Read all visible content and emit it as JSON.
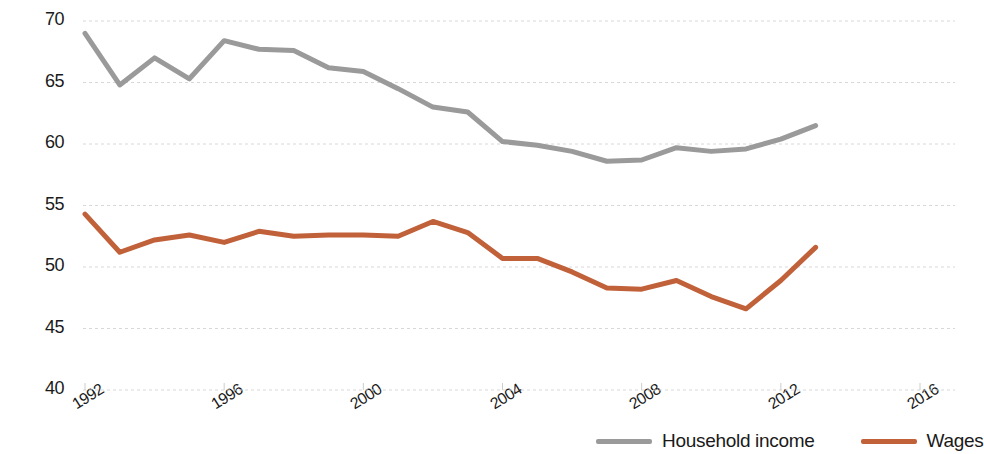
{
  "chart_data": {
    "type": "line",
    "title": "",
    "xlabel": "",
    "ylabel": "% of GDP",
    "xlim": [
      1992,
      2016.8
    ],
    "ylim": [
      40,
      70
    ],
    "grid": true,
    "legend_position": "bottom-right",
    "x_ticks": [
      "1992",
      "1996",
      "2000",
      "2004",
      "2008",
      "2012",
      "2016"
    ],
    "y_ticks": [
      "40",
      "45",
      "50",
      "55",
      "60",
      "65",
      "70"
    ],
    "x": [
      1992,
      1993,
      1994,
      1995,
      1996,
      1997,
      1998,
      1999,
      2000,
      2001,
      2002,
      2003,
      2004,
      2005,
      2006,
      2007,
      2008,
      2009,
      2010,
      2011,
      2012,
      2013
    ],
    "series": [
      {
        "name": "Household income",
        "color": "#9a9a9a",
        "values": [
          69.0,
          64.8,
          67.0,
          65.3,
          68.4,
          67.7,
          67.6,
          66.2,
          65.9,
          64.5,
          63.0,
          62.6,
          60.2,
          59.9,
          59.4,
          58.6,
          58.7,
          59.7,
          59.4,
          59.6,
          60.4,
          61.5
        ]
      },
      {
        "name": "Wages",
        "color": "#c1613a",
        "values": [
          54.3,
          51.2,
          52.2,
          52.6,
          52.0,
          52.9,
          52.5,
          52.6,
          52.6,
          52.5,
          53.7,
          52.8,
          50.7,
          50.7,
          49.6,
          48.3,
          48.2,
          48.9,
          47.6,
          46.6,
          48.9,
          51.6
        ]
      }
    ]
  },
  "legend": {
    "items": [
      {
        "label": "Household income",
        "color": "#9a9a9a"
      },
      {
        "label": "Wages",
        "color": "#c1613a"
      }
    ]
  }
}
